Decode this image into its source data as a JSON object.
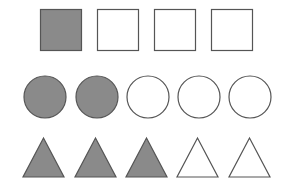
{
  "colors": {
    "filled": "#8a8a8a",
    "empty": "#ffffff",
    "stroke": "#555555",
    "background": "#ffffff"
  },
  "rows": [
    {
      "shape": "square",
      "items": [
        {
          "x": 40,
          "y": 9,
          "size": 41,
          "filled": true
        },
        {
          "x": 97,
          "y": 9,
          "size": 41,
          "filled": false
        },
        {
          "x": 154,
          "y": 9,
          "size": 41,
          "filled": false
        },
        {
          "x": 211,
          "y": 9,
          "size": 41,
          "filled": false
        }
      ]
    },
    {
      "shape": "circle",
      "items": [
        {
          "cx": 45,
          "cy": 97,
          "r": 21,
          "filled": true
        },
        {
          "cx": 97,
          "cy": 97,
          "r": 21,
          "filled": true
        },
        {
          "cx": 148,
          "cy": 97,
          "r": 21,
          "filled": false
        },
        {
          "cx": 199,
          "cy": 97,
          "r": 21,
          "filled": false
        },
        {
          "cx": 250,
          "cy": 97,
          "r": 21,
          "filled": false
        }
      ]
    },
    {
      "shape": "triangle",
      "items": [
        {
          "left": 23,
          "right": 64,
          "apexY": 138,
          "baseY": 177,
          "filled": true
        },
        {
          "left": 75,
          "right": 116,
          "apexY": 138,
          "baseY": 177,
          "filled": true
        },
        {
          "left": 126,
          "right": 167,
          "apexY": 138,
          "baseY": 177,
          "filled": true
        },
        {
          "left": 177,
          "right": 218,
          "apexY": 138,
          "baseY": 177,
          "filled": false
        },
        {
          "left": 229,
          "right": 270,
          "apexY": 138,
          "baseY": 177,
          "filled": false
        }
      ]
    }
  ],
  "summary": {
    "squares": {
      "filled": 1,
      "total": 4
    },
    "circles": {
      "filled": 2,
      "total": 5
    },
    "triangles": {
      "filled": 3,
      "total": 5
    }
  }
}
